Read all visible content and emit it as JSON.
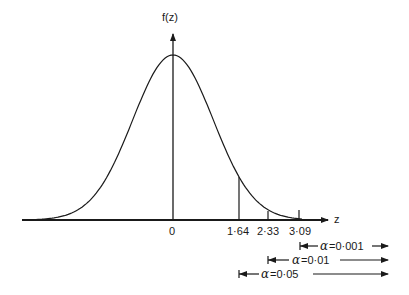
{
  "diagram": {
    "type": "standard-normal-distribution",
    "y_axis_label": "f(z)",
    "x_axis_label": "z",
    "origin_label": "0",
    "critical_values": [
      {
        "z": 1.64,
        "label": "1·64"
      },
      {
        "z": 2.33,
        "label": "2·33"
      },
      {
        "z": 3.09,
        "label": "3·09"
      }
    ],
    "significance_levels": [
      {
        "symbol": "α",
        "text": "=0·001",
        "from_z": 3.09
      },
      {
        "symbol": "α",
        "text": "=0·01",
        "from_z": 2.33
      },
      {
        "symbol": "α",
        "text": "=0·05",
        "from_z": 1.64
      }
    ],
    "line_color": "#1a1a1a"
  }
}
